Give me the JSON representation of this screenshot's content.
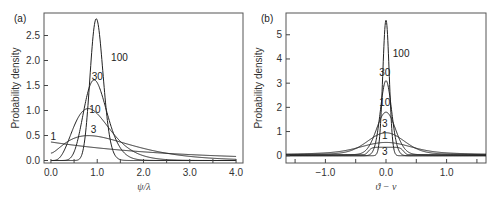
{
  "chart_data": [
    {
      "type": "line",
      "panel_label": "(a)",
      "xlabel": "ψ/λ",
      "ylabel": "Probability density",
      "xlim": [
        -0.15,
        4.15
      ],
      "ylim": [
        -0.05,
        2.95
      ],
      "xticks": [
        0.0,
        1.0,
        2.0,
        3.0,
        4.0
      ],
      "xtick_labels": [
        "0.0",
        "1.0",
        "2.0",
        "3.0",
        "4.0"
      ],
      "xminor_ticks": [
        0.5,
        1.5,
        2.5,
        3.5
      ],
      "yticks": [
        0.0,
        0.5,
        1.0,
        1.5,
        2.0,
        2.5
      ],
      "ytick_labels": [
        "0.0",
        "0.5",
        "1.0",
        "1.5",
        "2.0",
        "2.5"
      ],
      "grid": false,
      "series": [
        {
          "name": "1",
          "label": "1",
          "label_at": [
            0.05,
            0.42
          ],
          "peak_x": 0.0,
          "peak_y": 0.37,
          "values_at_x": {
            "0.0": 0.37,
            "1.0": 0.28,
            "2.0": 0.18,
            "3.0": 0.12,
            "4.0": 0.08
          }
        },
        {
          "name": "3",
          "label": "3",
          "label_at": [
            0.92,
            0.55
          ],
          "peak_x": 0.85,
          "peak_y": 0.5,
          "values_at_x": {
            "0.0": 0.15,
            "1.0": 0.49,
            "2.0": 0.24,
            "3.0": 0.09,
            "4.0": 0.04
          }
        },
        {
          "name": "10",
          "label": "10",
          "label_at": [
            0.95,
            0.95
          ],
          "peak_x": 0.97,
          "peak_y": 0.9,
          "values_at_x": {
            "0.0": 0.0,
            "1.0": 0.9,
            "2.0": 0.11,
            "3.0": 0.02,
            "4.0": 0.0
          }
        },
        {
          "name": "30",
          "label": "30",
          "label_at": [
            1.0,
            1.62
          ],
          "peak_x": 1.0,
          "peak_y": 1.55,
          "values_at_x": {
            "0.0": 0.0,
            "1.0": 1.55,
            "2.0": 0.0,
            "3.0": 0.0,
            "4.0": 0.0
          }
        },
        {
          "name": "100",
          "label": "100",
          "label_at": [
            1.48,
            2.0
          ],
          "peak_x": 1.0,
          "peak_y": 2.8,
          "values_at_x": {
            "0.0": 0.0,
            "1.0": 2.8,
            "2.0": 0.0,
            "3.0": 0.0,
            "4.0": 0.0
          }
        }
      ]
    },
    {
      "type": "line",
      "panel_label": "(b)",
      "xlabel": "ϑ − ν",
      "ylabel": "Probability density",
      "xlim": [
        -1.65,
        1.65
      ],
      "ylim": [
        -0.3,
        5.9
      ],
      "xticks": [
        -1.0,
        0.0,
        1.0
      ],
      "xtick_labels": [
        "−1.0",
        "0.0",
        "1.0"
      ],
      "xminor_ticks": [
        -1.5,
        -0.5,
        0.5,
        1.5
      ],
      "yticks": [
        0,
        1,
        2,
        3,
        4,
        5
      ],
      "ytick_labels": [
        "0",
        "1",
        "2",
        "3",
        "4",
        "5"
      ],
      "grid": false,
      "series": [
        {
          "name": "1",
          "label": "1",
          "label_at": [
            -0.02,
            0.68
          ],
          "peak_x": 0.0,
          "peak_y": 0.55,
          "tail_y": 0.15
        },
        {
          "name": "3",
          "label": "3",
          "label_at": [
            -0.02,
            1.2
          ],
          "peak_x": 0.0,
          "peak_y": 0.95,
          "tail_y": 0.1
        },
        {
          "name": "3b",
          "label": "3",
          "label_at": [
            -0.02,
            0.05
          ],
          "peak_x": 0.0,
          "peak_y": 0.35,
          "tail_y": 0.05
        },
        {
          "name": "10",
          "label": "10",
          "label_at": [
            -0.02,
            2.05
          ],
          "peak_x": 0.0,
          "peak_y": 1.8,
          "tail_y": 0.05
        },
        {
          "name": "30",
          "label": "30",
          "label_at": [
            -0.02,
            3.3
          ],
          "peak_x": 0.0,
          "peak_y": 3.1,
          "tail_y": 0.0
        },
        {
          "name": "100",
          "label": "100",
          "label_at": [
            0.25,
            4.1
          ],
          "peak_x": 0.0,
          "peak_y": 5.6,
          "tail_y": 0.0
        }
      ]
    }
  ]
}
